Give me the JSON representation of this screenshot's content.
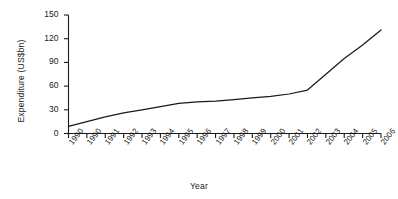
{
  "chart_data": {
    "type": "line",
    "title": "",
    "subtitle": "",
    "xlabel": "Year",
    "ylabel": "Expenditure  (US$bn)",
    "categories": [
      "1990",
      "1990",
      "1991",
      "1992",
      "1993",
      "1994",
      "1995",
      "1996",
      "1997",
      "1998",
      "1999",
      "2000",
      "2001",
      "2002",
      "2003",
      "2004",
      "2005",
      "2006"
    ],
    "x_tick_labels": [
      "1990",
      "1990",
      "1991",
      "1992",
      "1993",
      "1994",
      "1995",
      "1996",
      "1997",
      "1998",
      "1999",
      "2000",
      "2001",
      "2002",
      "2003",
      "2004",
      "2005",
      "2006"
    ],
    "y_tick_labels": [
      "0",
      "30",
      "60",
      "90",
      "120",
      "150"
    ],
    "y_ticks": [
      0,
      30,
      60,
      90,
      120,
      150
    ],
    "ylim": [
      0,
      150
    ],
    "grid": false,
    "legend": false,
    "legend_position": "none",
    "series": [
      {
        "name": "Expenditure",
        "color": "#1a1a1a",
        "values": [
          9,
          15,
          21,
          26,
          30,
          34,
          38,
          40,
          41,
          43,
          45,
          47,
          50,
          55,
          75,
          95,
          112,
          131
        ]
      }
    ],
    "annotations": []
  },
  "axes": {
    "x_axis_name": "Year",
    "y_axis_name": "Expenditure  (US$bn)"
  }
}
